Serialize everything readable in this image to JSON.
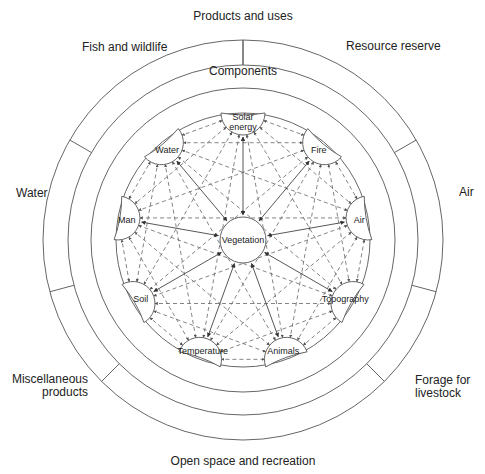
{
  "diagram": {
    "outer_ring_title": "Products and uses",
    "inner_ring_title": "Components",
    "center_node": "Vegetation",
    "products_and_uses": [
      {
        "id": "fish",
        "label": "Fish and wildlife"
      },
      {
        "id": "resource",
        "label": "Resource reserve"
      },
      {
        "id": "water_use",
        "label": "Water"
      },
      {
        "id": "air_use",
        "label": "Air"
      },
      {
        "id": "misc1",
        "label": "Miscellaneous"
      },
      {
        "id": "misc2",
        "label": "products"
      },
      {
        "id": "forage1",
        "label": "Forage for"
      },
      {
        "id": "forage2",
        "label": "livestock"
      },
      {
        "id": "open",
        "label": "Open space and recreation"
      }
    ],
    "components": [
      {
        "id": "solar",
        "lines": [
          "Solar",
          "energy"
        ],
        "angle": -90
      },
      {
        "id": "fire",
        "lines": [
          "Fire"
        ],
        "angle": -50
      },
      {
        "id": "air",
        "lines": [
          "Air"
        ],
        "angle": -10
      },
      {
        "id": "topography",
        "lines": [
          "Topography"
        ],
        "angle": 30
      },
      {
        "id": "animals",
        "lines": [
          "Animals"
        ],
        "angle": 70
      },
      {
        "id": "temperature",
        "lines": [
          "Temperature"
        ],
        "angle": 110
      },
      {
        "id": "soil",
        "lines": [
          "Soil"
        ],
        "angle": 150
      },
      {
        "id": "man",
        "lines": [
          "Man"
        ],
        "angle": 190
      },
      {
        "id": "water",
        "lines": [
          "Water"
        ],
        "angle": 230
      }
    ],
    "relationships": {
      "solid_arrows": "each component ↔ Vegetation",
      "dashed_arrows": "every component ↔ every other component"
    }
  }
}
